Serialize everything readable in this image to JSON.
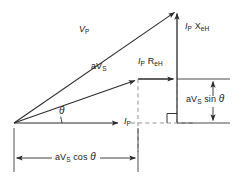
{
  "diagram": {
    "type": "phasor-diagram",
    "stroke_color": "#2b2b2b",
    "dash_color": "#8c8c8c",
    "text_color": "#1a1a1a",
    "background": "#ffffff",
    "origin": {
      "x": 14,
      "y": 123
    },
    "apex": {
      "x": 177,
      "y": 10
    },
    "avs_tip": {
      "x": 138,
      "y": 79
    }
  },
  "labels": {
    "vp": {
      "base": "V",
      "sub": "P"
    },
    "avs": {
      "prefix": "aV",
      "sub": "S"
    },
    "ip_rex": {
      "base": "I",
      "sub1": "P",
      "base2": "R",
      "sub2": "eH"
    },
    "ip_xex": {
      "base": "I",
      "sub1": "P",
      "base2": "X",
      "sub2": "eH"
    },
    "ip": {
      "base": "I",
      "sub": "P"
    },
    "theta": "θ",
    "avs_sin": {
      "prefix": "aV",
      "sub": "S",
      "suffix": "sin"
    },
    "avs_cos": {
      "prefix": "aV",
      "sub": "S",
      "suffix": "cos"
    }
  },
  "vectors": [
    {
      "name": "V_P",
      "from": "origin",
      "to": "apex",
      "style": "solid-arrow"
    },
    {
      "name": "aV_S",
      "from": "origin",
      "to": "avs_tip",
      "style": "solid-arrow"
    },
    {
      "name": "I_P",
      "from": "origin",
      "to": "horizontal",
      "style": "solid-arrow"
    },
    {
      "name": "I_P R_eH",
      "from": "avs_tip",
      "to": "corner",
      "style": "solid-arrow"
    },
    {
      "name": "I_P X_eH",
      "from": "corner",
      "to": "apex",
      "style": "solid-arrow"
    }
  ],
  "dimensions": [
    {
      "name": "aV_S cos theta",
      "orientation": "horizontal",
      "position": "bottom"
    },
    {
      "name": "aV_S sin theta",
      "orientation": "vertical",
      "position": "right"
    }
  ],
  "markers": [
    {
      "name": "right-angle",
      "x": 168,
      "y": 115
    },
    {
      "name": "angle-arc",
      "label": "theta"
    }
  ]
}
